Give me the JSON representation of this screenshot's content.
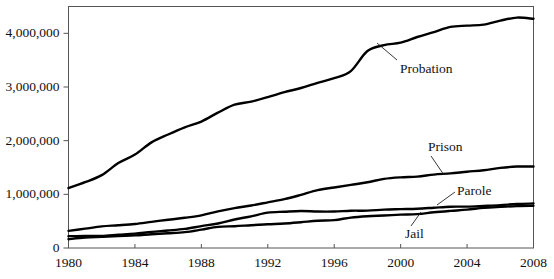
{
  "chart_data": {
    "type": "line",
    "title": "",
    "subtitle": "",
    "xlabel": "",
    "ylabel": "",
    "grid": false,
    "legend_position": "inline-annotations",
    "xlim": [
      1980,
      2008
    ],
    "ylim": [
      0,
      4500000
    ],
    "x_ticks": [
      "1980",
      "1984",
      "1988",
      "1992",
      "1996",
      "2000",
      "2004",
      "2008"
    ],
    "x_tick_values": [
      1980,
      1984,
      1988,
      1992,
      1996,
      2000,
      2004,
      2008
    ],
    "y_ticks": [
      "0",
      "1,000,000",
      "2,000,000",
      "3,000,000",
      "4,000,000"
    ],
    "y_tick_values": [
      0,
      1000000,
      2000000,
      3000000,
      4000000
    ],
    "x": [
      1980,
      1981,
      1982,
      1983,
      1984,
      1985,
      1986,
      1987,
      1988,
      1989,
      1990,
      1991,
      1992,
      1993,
      1994,
      1995,
      1996,
      1997,
      1998,
      1999,
      2000,
      2001,
      2002,
      2003,
      2004,
      2005,
      2006,
      2007,
      2008
    ],
    "series": [
      {
        "name": "Probation",
        "label": "Probation",
        "color": "#000000",
        "values": [
          1118097,
          1225934,
          1357264,
          1582947,
          1740948,
          1968712,
          2114621,
          2247158,
          2356483,
          2522125,
          2670234,
          2728472,
          2811611,
          2903061,
          2981022,
          3077861,
          3164996,
          3296513,
          3670441,
          3779922,
          3826209,
          3931731,
          4024067,
          4120012,
          4143792,
          4162536,
          4236800,
          4293163,
          4270917
        ]
      },
      {
        "name": "Prison",
        "label": "Prison",
        "color": "#000000",
        "values": [
          319598,
          360029,
          402914,
          423898,
          448264,
          487593,
          526436,
          562814,
          607766,
          683367,
          743382,
          792535,
          850566,
          909381,
          990147,
          1078542,
          1127528,
          1176564,
          1224469,
          1287172,
          1316333,
          1330007,
          1367856,
          1390279,
          1421345,
          1448344,
          1492973,
          1517867,
          1518559
        ]
      },
      {
        "name": "Parole",
        "label": "Parole",
        "color": "#000000",
        "values": [
          220438,
          225539,
          224604,
          246440,
          266992,
          300203,
          325638,
          355505,
          407977,
          456803,
          531407,
          590442,
          658601,
          676100,
          690371,
          679421,
          679733,
          694787,
          696385,
          714457,
          723898,
          732333,
          750934,
          769925,
          771852,
          784408,
          798202,
          821177,
          828169
        ]
      },
      {
        "name": "Jail",
        "label": "Jail",
        "color": "#000000",
        "values": [
          163994,
          195085,
          209582,
          223551,
          234500,
          256615,
          274444,
          295873,
          341893,
          393303,
          405320,
          424129,
          441781,
          455500,
          479800,
          507044,
          518492,
          567079,
          592462,
          605943,
          621149,
          631240,
          665475,
          691301,
          713990,
          747529,
          765819,
          780174,
          785556
        ]
      }
    ]
  },
  "axes": {
    "y_labels": [
      {
        "text": "4,000,000",
        "value": 4000000
      },
      {
        "text": "3,000,000",
        "value": 3000000
      },
      {
        "text": "2,000,000",
        "value": 2000000
      },
      {
        "text": "1,000,000",
        "value": 1000000
      },
      {
        "text": "0",
        "value": 0
      }
    ],
    "x_labels": [
      {
        "text": "1980",
        "value": 1980
      },
      {
        "text": "1984",
        "value": 1984
      },
      {
        "text": "1988",
        "value": 1988
      },
      {
        "text": "1992",
        "value": 1992
      },
      {
        "text": "1996",
        "value": 1996
      },
      {
        "text": "2000",
        "value": 2000
      },
      {
        "text": "2004",
        "value": 2004
      },
      {
        "text": "2008",
        "value": 2008
      }
    ]
  },
  "annotations": [
    {
      "name": "probation",
      "text": "Probation",
      "x": 400,
      "y": 62,
      "leader": {
        "x1": 397,
        "y1": 60,
        "x2": 377,
        "y2": 43
      }
    },
    {
      "name": "prison",
      "text": "Prison",
      "x": 428,
      "y": 140,
      "leader": {
        "x1": 431,
        "y1": 156,
        "x2": 444,
        "y2": 175
      }
    },
    {
      "name": "parole",
      "text": "Parole",
      "x": 457,
      "y": 184,
      "leader": {
        "x1": 455,
        "y1": 192,
        "x2": 437,
        "y2": 205
      }
    },
    {
      "name": "jail",
      "text": "Jail",
      "x": 405,
      "y": 227,
      "leader": {
        "x1": 411,
        "y1": 226,
        "x2": 421,
        "y2": 212
      }
    }
  ],
  "style": {
    "axis_color": "#555555",
    "line_color": "#000000",
    "background": "#ffffff"
  }
}
